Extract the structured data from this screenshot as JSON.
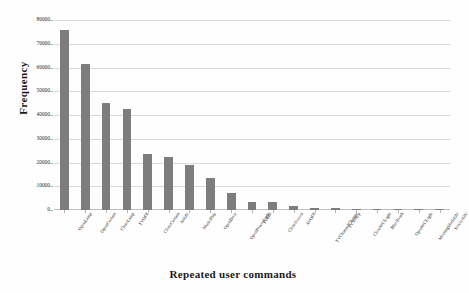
{
  "chart_data": {
    "type": "bar",
    "title": "",
    "xlabel": "Repeated user commands",
    "ylabel": "Frequency",
    "ylim": [
      0,
      80000
    ],
    "ytick_values": [
      0,
      10000,
      20000,
      30000,
      40000,
      50000,
      60000,
      70000,
      80000
    ],
    "ytick_labels": [
      "0",
      "10000",
      "20000",
      "30000",
      "40000",
      "50000",
      "60000",
      "70000",
      "80000"
    ],
    "grid": true,
    "legend": "none",
    "bar_color": "#7d7d7d",
    "grid_color": "#d9d9d9",
    "categories": [
      "OpenLamp",
      "OpenCurtain",
      "CloseLamp",
      "TVOFF",
      "CloseCurtain",
      "AirON",
      "MusicPlay",
      "OpenDoor",
      "OpenPowerLight",
      "TVON",
      "CloseScreen",
      "AirOFF",
      "TVChannelChange",
      "TVVolUp",
      "CloseWCLight",
      "BlueTooth",
      "OpenWCLight",
      "MeetingModeON",
      "ServiceON"
    ],
    "values": [
      76000,
      61500,
      45000,
      42500,
      23500,
      22500,
      19000,
      13500,
      7000,
      3500,
      3200,
      1800,
      900,
      800,
      400,
      300,
      250,
      200,
      150
    ]
  }
}
